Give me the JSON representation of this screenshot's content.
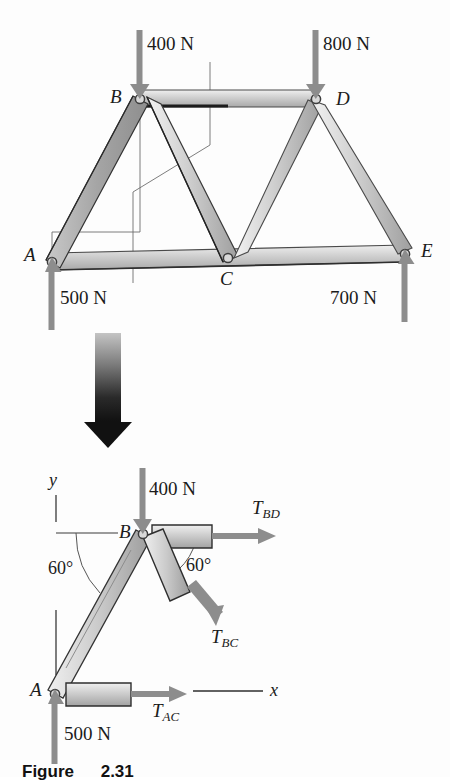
{
  "figure": {
    "caption_label": "Figure",
    "caption_number": "2.31"
  },
  "truss": {
    "title": "Five-joint truss with applied loads and support reactions",
    "joints": [
      {
        "id": "A",
        "label": "A",
        "x": 52,
        "y": 262
      },
      {
        "id": "B",
        "label": "B",
        "x": 140,
        "y": 98
      },
      {
        "id": "C",
        "label": "C",
        "x": 228,
        "y": 258
      },
      {
        "id": "D",
        "label": "D",
        "x": 316,
        "y": 98
      },
      {
        "id": "E",
        "label": "E",
        "x": 405,
        "y": 254
      }
    ],
    "members": [
      {
        "from": "A",
        "to": "B"
      },
      {
        "from": "B",
        "to": "C"
      },
      {
        "from": "B",
        "to": "D"
      },
      {
        "from": "C",
        "to": "D"
      },
      {
        "from": "D",
        "to": "E"
      },
      {
        "from": "A",
        "to": "C"
      },
      {
        "from": "C",
        "to": "E"
      }
    ],
    "forces": [
      {
        "name": "load-at-B",
        "label": "400 N",
        "at": "B",
        "direction": "down",
        "value": 400,
        "unit": "N"
      },
      {
        "name": "load-at-D",
        "label": "800 N",
        "at": "D",
        "direction": "down",
        "value": 800,
        "unit": "N"
      },
      {
        "name": "reaction-at-A",
        "label": "500 N",
        "at": "A",
        "direction": "up",
        "value": 500,
        "unit": "N"
      },
      {
        "name": "reaction-at-E",
        "label": "700 N",
        "at": "E",
        "direction": "up",
        "value": 700,
        "unit": "N"
      }
    ]
  },
  "transition": {
    "arrow_name": "down-arrow-icon"
  },
  "fbd": {
    "title": "Free-body diagram of member AB at joint B",
    "joints": [
      {
        "id": "A",
        "label": "A",
        "x": 55,
        "y": 693
      },
      {
        "id": "B",
        "label": "B",
        "x": 143,
        "y": 533
      }
    ],
    "axes": {
      "y_label": "y",
      "x_label": "x"
    },
    "angles": [
      {
        "name": "angle-AB-from-y",
        "label": "60°",
        "value": 60,
        "unit": "deg"
      },
      {
        "name": "angle-BC-from-BD",
        "label": "60°",
        "value": 60,
        "unit": "deg"
      }
    ],
    "forces": [
      {
        "name": "load-400N",
        "label": "400 N",
        "value": 400,
        "unit": "N",
        "direction": "down"
      },
      {
        "name": "reaction-500N",
        "label": "500 N",
        "value": 500,
        "unit": "N",
        "direction": "up"
      }
    ],
    "tensions": [
      {
        "name": "T-BD",
        "symbol": "T",
        "subscript": "BD",
        "direction": "right"
      },
      {
        "name": "T-BC",
        "symbol": "T",
        "subscript": "BC",
        "direction": "down-right"
      },
      {
        "name": "T-AC",
        "symbol": "T",
        "subscript": "AC",
        "direction": "right"
      }
    ]
  },
  "colors": {
    "member_fill_light": "#dcdcdc",
    "member_fill_mid": "#b9b9b9",
    "member_stroke": "#3a3a3a",
    "force_arrow": "#8a8a8a",
    "thin_line": "#6e6e6e",
    "text": "#1b1b1b"
  }
}
